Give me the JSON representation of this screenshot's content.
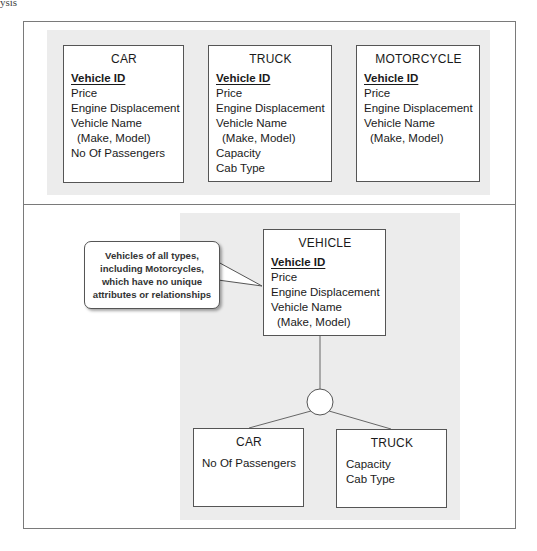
{
  "page_header": "ysis",
  "top_section": {
    "entities": [
      {
        "title": "CAR",
        "primary_key": "Vehicle ID",
        "attributes": [
          "Price",
          "Engine Displacement",
          "Vehicle Name",
          "(Make, Model)",
          "No Of Passengers"
        ]
      },
      {
        "title": "TRUCK",
        "primary_key": "Vehicle ID",
        "attributes": [
          "Price",
          "Engine Displacement",
          "Vehicle Name",
          "(Make, Model)",
          "Capacity",
          "Cab Type"
        ]
      },
      {
        "title": "MOTORCYCLE",
        "primary_key": "Vehicle ID",
        "attributes": [
          "Price",
          "Engine Displacement",
          "Vehicle Name",
          "(Make, Model)"
        ]
      }
    ]
  },
  "bottom_section": {
    "supertype": {
      "title": "VEHICLE",
      "primary_key": "Vehicle ID",
      "attributes": [
        "Price",
        "Engine Displacement",
        "Vehicle Name",
        "(Make, Model)"
      ]
    },
    "callout": {
      "lines": [
        "Vehicles of all types,",
        "including Motorcycles,",
        "which have no unique",
        "attributes or relationships"
      ]
    },
    "subtypes": [
      {
        "title": "CAR",
        "attributes": [
          "No Of Passengers"
        ]
      },
      {
        "title": "TRUCK",
        "attributes": [
          "Capacity",
          "Cab Type"
        ]
      }
    ]
  },
  "colors": {
    "panel_gray": "#ececec",
    "border": "#555555",
    "frame": "#7a7a7a"
  }
}
